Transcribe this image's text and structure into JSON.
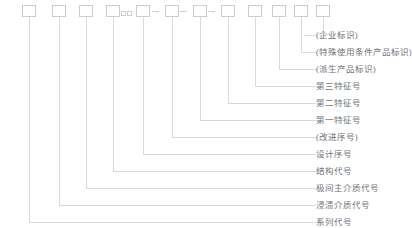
{
  "diagram": {
    "colors": {
      "line": "#d7d9dd",
      "box_border": "#c9ccd1",
      "text": "#6e7279",
      "background": "#ffffff"
    },
    "boxes": [
      {
        "id": 1,
        "x": 22,
        "value": ""
      },
      {
        "id": 2,
        "x": 52,
        "value": ""
      },
      {
        "id": 3,
        "x": 79,
        "value": ""
      },
      {
        "id": 4,
        "x": 106,
        "value": ""
      },
      {
        "id": 5,
        "x": 136,
        "value": ""
      },
      {
        "id": 6,
        "x": 165,
        "value": ""
      },
      {
        "id": 7,
        "x": 193,
        "value": ""
      },
      {
        "id": 8,
        "x": 221,
        "value": ""
      },
      {
        "id": 9,
        "x": 248,
        "value": ""
      },
      {
        "id": 10,
        "x": 272,
        "value": ""
      },
      {
        "id": 11,
        "x": 294,
        "value": ""
      },
      {
        "id": 12,
        "x": 316,
        "value": ""
      }
    ],
    "sub_boxes": [
      {
        "id": "sub-1",
        "x": 121,
        "value": ""
      },
      {
        "id": "sub-2",
        "x": 127,
        "value": ""
      }
    ],
    "dashes": [
      {
        "id": "dash-1",
        "x": 152
      },
      {
        "id": "dash-2",
        "x": 180
      },
      {
        "id": "dash-3",
        "x": 208
      }
    ],
    "labels": [
      {
        "id": 1,
        "text": "(企业标识)",
        "y": 31,
        "source_box": 12,
        "turn_y": 35
      },
      {
        "id": 2,
        "text": "(特殊使用条件产品标识)",
        "y": 48,
        "source_box": 11,
        "turn_y": 52
      },
      {
        "id": 3,
        "text": "(派生产品标识)",
        "y": 65,
        "source_box": 10,
        "turn_y": 69
      },
      {
        "id": 4,
        "text": "第三特征号",
        "y": 82,
        "source_box": 9,
        "turn_y": 86
      },
      {
        "id": 5,
        "text": "第二特征号",
        "y": 99,
        "source_box": 8,
        "turn_y": 103
      },
      {
        "id": 6,
        "text": "第一特征号",
        "y": 116,
        "source_box": 7,
        "turn_y": 120
      },
      {
        "id": 7,
        "text": "(改进序号)",
        "y": 133,
        "source_box": 6,
        "turn_y": 137
      },
      {
        "id": 8,
        "text": "设计序号",
        "y": 150,
        "source_box": 5,
        "turn_y": 154
      },
      {
        "id": 9,
        "text": "结构代号",
        "y": 167,
        "source_box": 4,
        "turn_y": 171
      },
      {
        "id": 10,
        "text": "极间主介质代号",
        "y": 184,
        "source_box": 3,
        "turn_y": 188
      },
      {
        "id": 11,
        "text": "浸渍介质代号",
        "y": 201,
        "source_box": 2,
        "turn_y": 205
      },
      {
        "id": 12,
        "text": "系列代号",
        "y": 218,
        "source_box": 1,
        "turn_y": 222
      }
    ]
  }
}
